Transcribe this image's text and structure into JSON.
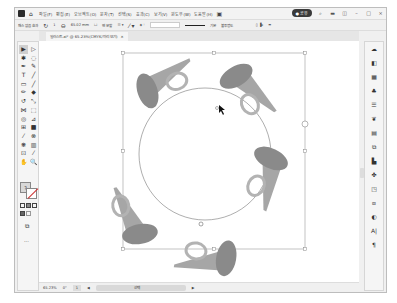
{
  "menubar": {
    "items": [
      "파일(F)",
      "편집(E)",
      "오브젝트(O)",
      "문자(T)",
      "선택(S)",
      "효과(C)",
      "보기(V)",
      "윈도우(W)",
      "도움말(H)"
    ],
    "share_label": "공유",
    "icons": [
      "logo-icon",
      "home-icon",
      "search-icon",
      "arrange-icon",
      "panel-icon"
    ],
    "window_controls": [
      "–",
      "□",
      "×"
    ]
  },
  "controlbar": {
    "selection_label": "패스 없음 효과",
    "rotate_value": "1",
    "width_value": "65.02 mm",
    "checkbox_label": "면 분할",
    "stroke_weight": "기본",
    "style_label": "불투명도"
  },
  "document_tab": {
    "title": "일러스트.ai* @ 65.23%(CMYK/미리 보기)",
    "close": "×"
  },
  "toolbar": {
    "tools": [
      {
        "name": "selection-tool",
        "glyph": "▶",
        "active": true
      },
      {
        "name": "direct-selection-tool",
        "glyph": "▷"
      },
      {
        "name": "magic-wand-tool",
        "glyph": "✱"
      },
      {
        "name": "lasso-tool",
        "glyph": "◌"
      },
      {
        "name": "pen-tool",
        "glyph": "✒"
      },
      {
        "name": "curvature-tool",
        "glyph": "✎"
      },
      {
        "name": "type-tool",
        "glyph": "T"
      },
      {
        "name": "line-tool",
        "glyph": "╱"
      },
      {
        "name": "rectangle-tool",
        "glyph": "▭"
      },
      {
        "name": "paintbrush-tool",
        "glyph": "╱"
      },
      {
        "name": "pencil-tool",
        "glyph": "✏"
      },
      {
        "name": "eraser-tool",
        "glyph": "◆"
      },
      {
        "name": "rotate-tool",
        "glyph": "↺"
      },
      {
        "name": "scale-tool",
        "glyph": "⤡"
      },
      {
        "name": "width-tool",
        "glyph": "⋈"
      },
      {
        "name": "free-transform-tool",
        "glyph": "⬚"
      },
      {
        "name": "shape-builder-tool",
        "glyph": "◎"
      },
      {
        "name": "perspective-tool",
        "glyph": "⊿"
      },
      {
        "name": "mesh-tool",
        "glyph": "⊞"
      },
      {
        "name": "gradient-tool",
        "glyph": "■"
      },
      {
        "name": "eyedropper-tool",
        "glyph": "⁄"
      },
      {
        "name": "blend-tool",
        "glyph": "⊗"
      },
      {
        "name": "symbol-sprayer-tool",
        "glyph": "❋"
      },
      {
        "name": "graph-tool",
        "glyph": "▥"
      },
      {
        "name": "artboard-tool",
        "glyph": "⊡"
      },
      {
        "name": "slice-tool",
        "glyph": "⁄"
      },
      {
        "name": "hand-tool",
        "glyph": "✋"
      },
      {
        "name": "zoom-tool",
        "glyph": "🔍"
      }
    ],
    "fill_label": "?",
    "more_label": "···"
  },
  "right_panel": {
    "icons": [
      "properties-icon",
      "layers-icon",
      "libraries-icon",
      "swatches-icon",
      "brushes-icon",
      "symbols-icon",
      "graphic-styles-icon",
      "appearance-icon",
      "align-icon",
      "pathfinder-icon",
      "transform-icon",
      "artboards-icon",
      "color-icon",
      "character-icon",
      "paragraph-icon"
    ],
    "glyphs": [
      "☁",
      "◧",
      "▦",
      "♣",
      "☰",
      "❦",
      "▤",
      "⧉",
      "▙",
      "✤",
      "◳",
      "⧈",
      "◐",
      "A|",
      "¶"
    ]
  },
  "statusbar": {
    "zoom": "65.23%",
    "rotation": "0°",
    "artboard": "1",
    "tool_label": "선택",
    "nav_arrows": [
      "◀",
      "▶"
    ]
  },
  "canvas": {
    "circle_radius": 80,
    "horn_count": 5,
    "horn_colors": {
      "bell": "#8c8c8c",
      "body": "#a8a8a8",
      "loop": "#b5b5b5"
    },
    "selection_color": "#888888"
  }
}
